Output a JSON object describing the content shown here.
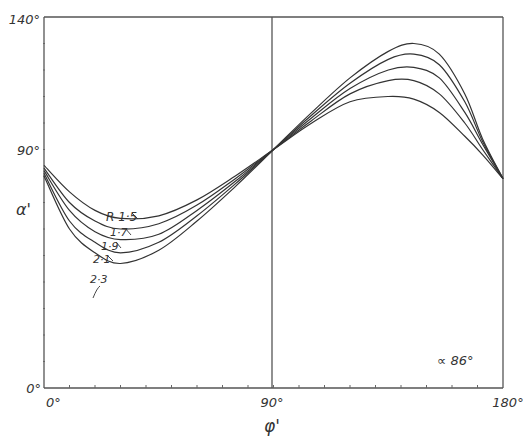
{
  "chart_data": {
    "type": "line",
    "title": "",
    "xlabel": "φ'",
    "ylabel": "α'",
    "xlim": [
      0,
      180
    ],
    "ylim": [
      0,
      140
    ],
    "x_ticks": [
      "0°",
      "90°",
      "180°"
    ],
    "y_ticks": [
      "0°",
      "90°",
      "140°"
    ],
    "grid": false,
    "annotation": "∝ 86°",
    "series_label_prefix": "R",
    "x": [
      0,
      10,
      20,
      30,
      45,
      60,
      75,
      90,
      105,
      120,
      135,
      145,
      155,
      165,
      172,
      180
    ],
    "series": [
      {
        "name": "R 1.5",
        "label": "R 1·5",
        "values": [
          84,
          74,
          67,
          64,
          65,
          71,
          80,
          90,
          100,
          108,
          110,
          109,
          104,
          95,
          88,
          79
        ]
      },
      {
        "name": "R 1.7",
        "label": "1·7",
        "values": [
          83,
          70,
          63,
          60,
          62,
          69,
          79,
          90,
          101,
          111,
          116,
          116,
          111,
          100,
          90,
          79
        ]
      },
      {
        "name": "R 1.9",
        "label": "1·9",
        "values": [
          82,
          67,
          59,
          56,
          58,
          67,
          78,
          90,
          102,
          113,
          120,
          121,
          117,
          104,
          92,
          79
        ]
      },
      {
        "name": "R 2.1",
        "label": "2·1",
        "values": [
          81,
          63,
          55,
          51,
          55,
          65,
          77,
          90,
          103,
          115,
          124,
          126,
          122,
          108,
          93,
          79
        ]
      },
      {
        "name": "R 2.3",
        "label": "2·3",
        "values": [
          80,
          60,
          51,
          47,
          52,
          63,
          76,
          90,
          104,
          117,
          127,
          130,
          126,
          111,
          94,
          79
        ]
      }
    ]
  },
  "axes": {
    "y_top_label": "140°",
    "y_mid_label": "90°",
    "y_zero_label": "0°",
    "x_left_label": "0°",
    "x_mid_label": "90°",
    "x_right_label": "180°",
    "x_title": "φ'",
    "y_title": "α'"
  },
  "annotation": "∝ 86°"
}
